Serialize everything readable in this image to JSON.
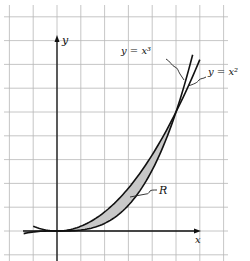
{
  "figure": {
    "labels": {
      "y_axis": "y",
      "x_axis": "x",
      "curve_cubic": "y = x³",
      "curve_square": "y = x²",
      "region": "R"
    },
    "colors": {
      "grid": "#b8b8b8",
      "ink": "#111111",
      "region_fill": "#c8c8c8",
      "background": "#ffffff"
    },
    "geometry": {
      "origin_px": [
        57,
        231
      ],
      "unit_px": 119,
      "grid_spacing_px": 23.8
    },
    "curves": [
      {
        "name": "y = x^2",
        "x_range": [
          -0.2,
          1.2
        ]
      },
      {
        "name": "y = x^3",
        "x_range": [
          -0.28,
          1.14
        ]
      }
    ],
    "region": {
      "name": "R",
      "description": "Shaded area between y = x^2 and y = x^3 for 0 ≤ x ≤ 1"
    },
    "intersection_points": [
      [
        0,
        0
      ],
      [
        1,
        1
      ]
    ]
  }
}
